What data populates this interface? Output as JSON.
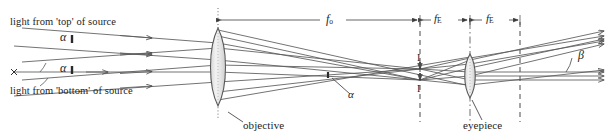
{
  "figure": {
    "name": "compound-microscope-ray-diagram",
    "background": "#ffffff",
    "ink_color": "#4a4a4a",
    "text_color": "#1d1d1d",
    "width": 614,
    "height": 139
  },
  "labels": {
    "top_source": "light from 'top' of source",
    "bottom_source": "light from 'bottom' of source",
    "objective": "objective",
    "eyepiece": "eyepiece",
    "image_upper": "I",
    "image_lower": "I",
    "alpha_top": "α",
    "alpha_bottom": "α",
    "alpha_middle": "α",
    "beta": "β",
    "f_objective": "f",
    "f_objective_sub": "o",
    "f_eyepiece_1": "f",
    "f_eyepiece_1_sub": "E",
    "f_eyepiece_2": "f",
    "f_eyepiece_2_sub": "E"
  },
  "geometry": {
    "objective_x": 218,
    "eyepiece_x": 470,
    "image_plane_x": 420,
    "focal_plane_x": 520,
    "axis_y": 72,
    "dimension_row_y": 20
  }
}
